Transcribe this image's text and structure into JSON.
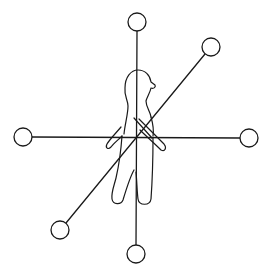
{
  "diagram": {
    "center": [
      137,
      137
    ],
    "colors": {
      "stroke": "#1a1a1a",
      "background": "#ffffff"
    },
    "axes": [
      {
        "name": "vertical-axis",
        "from": [
          137,
          22
        ],
        "to": [
          136,
          254
        ]
      },
      {
        "name": "horizontal-axis",
        "from": [
          23,
          137
        ],
        "to": [
          249,
          138
        ]
      },
      {
        "name": "diagonal-axis",
        "from": [
          211,
          47
        ],
        "to": [
          60,
          230
        ]
      }
    ],
    "nodes": [
      {
        "name": "node-top",
        "cx": 137,
        "cy": 22,
        "r": 9
      },
      {
        "name": "node-bottom",
        "cx": 136,
        "cy": 254,
        "r": 9
      },
      {
        "name": "node-left",
        "cx": 23,
        "cy": 137,
        "r": 9
      },
      {
        "name": "node-right",
        "cx": 249,
        "cy": 138,
        "r": 9
      },
      {
        "name": "node-upper-right",
        "cx": 211,
        "cy": 47,
        "r": 9
      },
      {
        "name": "node-lower-left",
        "cx": 60,
        "cy": 230,
        "r": 9
      }
    ]
  }
}
